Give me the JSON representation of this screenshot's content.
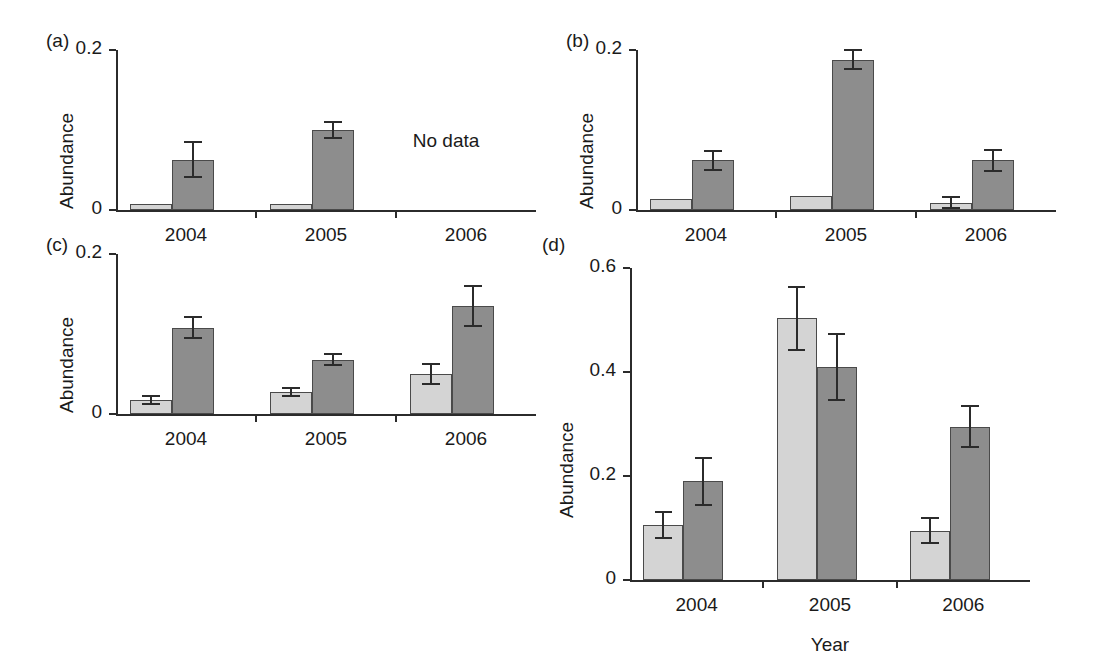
{
  "figure": {
    "xaxis_title": "Year",
    "panels": [
      {
        "id": "a",
        "label": "(a)",
        "ylabel": "Abundance",
        "yticks": [
          "0.2",
          "0"
        ],
        "ytick_values": [
          0.2,
          0
        ],
        "ylim": [
          0,
          0.2
        ],
        "xticklabels": [
          "2004",
          "2005",
          "2006"
        ],
        "note": "No data",
        "note_group": "2006"
      },
      {
        "id": "b",
        "label": "(b)",
        "ylabel": "Abundance",
        "yticks": [
          "0.2",
          "0"
        ],
        "ytick_values": [
          0.2,
          0
        ],
        "ylim": [
          0,
          0.2
        ],
        "xticklabels": [
          "2004",
          "2005",
          "2006"
        ],
        "note": "",
        "note_group": ""
      },
      {
        "id": "c",
        "label": "(c)",
        "ylabel": "Abundance",
        "yticks": [
          "0.2",
          "0"
        ],
        "ytick_values": [
          0.2,
          0
        ],
        "ylim": [
          0,
          0.2
        ],
        "xticklabels": [
          "2004",
          "2005",
          "2006"
        ],
        "note": "",
        "note_group": ""
      },
      {
        "id": "d",
        "label": "(d)",
        "ylabel": "Abundance",
        "yticks": [
          "0.6",
          "0.4",
          "0.2",
          "0"
        ],
        "ytick_values": [
          0.6,
          0.4,
          0.2,
          0
        ],
        "ylim": [
          0,
          0.6
        ],
        "xticklabels": [
          "2004",
          "2005",
          "2006"
        ],
        "note": "",
        "note_group": ""
      }
    ]
  },
  "colors": {
    "light_bar": "#d4d4d4",
    "dark_bar": "#8d8d8d",
    "bar_outline": "#4a4a4a",
    "axis": "#2b2b2b",
    "text": "#1a1a1a",
    "background": "#ffffff"
  },
  "chart_data": [
    {
      "type": "bar",
      "panel": "a",
      "title": "(a)",
      "xlabel": "",
      "ylabel": "Abundance",
      "categories": [
        "2004",
        "2005",
        "2006"
      ],
      "ylim": [
        0,
        0.2
      ],
      "yticks": [
        0,
        0.2
      ],
      "grid": false,
      "legend": "none",
      "annotations": [
        "No data"
      ],
      "series": [
        {
          "name": "light",
          "values": [
            0.007,
            0.008,
            null
          ],
          "errors": [
            0.0,
            0.0,
            null
          ]
        },
        {
          "name": "dark",
          "values": [
            0.063,
            0.1,
            null
          ],
          "errors": [
            0.022,
            0.01,
            null
          ]
        }
      ]
    },
    {
      "type": "bar",
      "panel": "b",
      "title": "(b)",
      "xlabel": "",
      "ylabel": "Abundance",
      "categories": [
        "2004",
        "2005",
        "2006"
      ],
      "ylim": [
        0,
        0.2
      ],
      "yticks": [
        0,
        0.2
      ],
      "grid": false,
      "legend": "none",
      "annotations": [],
      "series": [
        {
          "name": "light",
          "values": [
            0.014,
            0.018,
            0.009
          ],
          "errors": [
            0.0,
            0.0,
            0.007
          ]
        },
        {
          "name": "dark",
          "values": [
            0.062,
            0.188,
            0.062
          ],
          "errors": [
            0.012,
            0.012,
            0.013
          ]
        }
      ]
    },
    {
      "type": "bar",
      "panel": "c",
      "title": "(c)",
      "xlabel": "",
      "ylabel": "Abundance",
      "categories": [
        "2004",
        "2005",
        "2006"
      ],
      "ylim": [
        0,
        0.2
      ],
      "yticks": [
        0,
        0.2
      ],
      "grid": false,
      "legend": "none",
      "annotations": [],
      "series": [
        {
          "name": "light",
          "values": [
            0.018,
            0.028,
            0.05
          ],
          "errors": [
            0.005,
            0.005,
            0.013
          ]
        },
        {
          "name": "dark",
          "values": [
            0.108,
            0.068,
            0.135
          ],
          "errors": [
            0.013,
            0.007,
            0.025
          ]
        }
      ]
    },
    {
      "type": "bar",
      "panel": "d",
      "title": "(d)",
      "xlabel": "Year",
      "ylabel": "Abundance",
      "categories": [
        "2004",
        "2005",
        "2006"
      ],
      "ylim": [
        0,
        0.6
      ],
      "yticks": [
        0,
        0.2,
        0.4,
        0.6
      ],
      "grid": false,
      "legend": "none",
      "annotations": [],
      "series": [
        {
          "name": "light",
          "values": [
            0.105,
            0.503,
            0.095
          ],
          "errors": [
            0.025,
            0.06,
            0.024
          ]
        },
        {
          "name": "dark",
          "values": [
            0.19,
            0.41,
            0.295
          ],
          "errors": [
            0.045,
            0.063,
            0.04
          ]
        }
      ]
    }
  ]
}
